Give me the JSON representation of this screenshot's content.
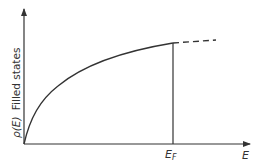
{
  "diagram": {
    "title": "",
    "y_axis_label": {
      "symbol": "ρ(E)",
      "text": "Filled states"
    },
    "x_axis_label": "E",
    "marker_label": {
      "main": "E",
      "sub": "F"
    },
    "colors": {
      "line": "#333333",
      "background": "#ffffff"
    }
  }
}
